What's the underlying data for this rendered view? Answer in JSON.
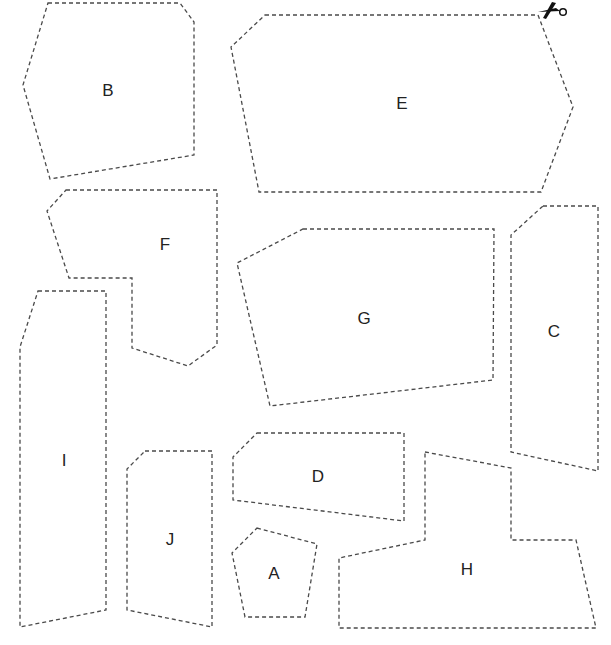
{
  "sheet": {
    "width": 611,
    "height": 645,
    "line_color": "#4a4a4a",
    "label_color": "#222222",
    "scissors_icon": "scissors-icon"
  },
  "pieces": [
    {
      "label": "B",
      "points": "48,3 180,3 194,22 194,155 50,179 23,85",
      "label_x": 108,
      "label_y": 90
    },
    {
      "label": "E",
      "points": "265,15 538,15 573,107 541,192 259,192 231,47",
      "label_x": 402,
      "label_y": 103
    },
    {
      "label": "F",
      "points": "66,190 217,190 217,345 188,366 132,348 132,278 69,278 47,211",
      "label_x": 165,
      "label_y": 244
    },
    {
      "label": "G",
      "points": "303,229 494,229 493,380 270,406 237,263",
      "label_x": 364,
      "label_y": 318
    },
    {
      "label": "C",
      "points": "543,206 598,206 598,471 511,452 511,235",
      "label_x": 554,
      "label_y": 331
    },
    {
      "label": "I",
      "points": "38,291 106,291 106,610 20,627 20,347",
      "label_x": 64,
      "label_y": 460
    },
    {
      "label": "D",
      "points": "257,433 404,433 404,521 233,500 233,457",
      "label_x": 318,
      "label_y": 476
    },
    {
      "label": "J",
      "points": "145,451 212,451 212,627 127,610 127,469",
      "label_x": 170,
      "label_y": 539
    },
    {
      "label": "A",
      "points": "257,528 317,544 305,617 245,617 232,553",
      "label_x": 274,
      "label_y": 573
    },
    {
      "label": "H",
      "points": "425,452 511,468 511,540 576,540 596,628 339,628 339,558 425,540",
      "label_x": 467,
      "label_y": 569
    }
  ]
}
